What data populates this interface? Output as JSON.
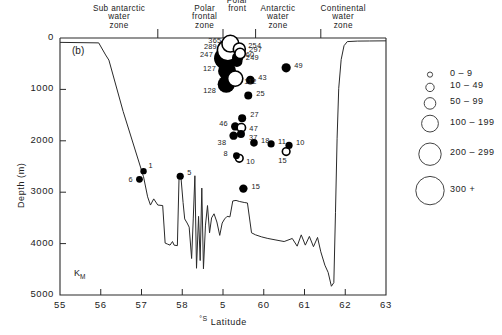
{
  "figure": {
    "panel_id": "(b)",
    "section_code": "K",
    "section_code_sub": "M"
  },
  "axes": {
    "x": {
      "label_prefix": "°S",
      "label": "Latitude",
      "min": 55,
      "max": 63,
      "ticks": [
        "55",
        "56",
        "57",
        "58",
        "5",
        "60",
        "61",
        "62",
        "63"
      ]
    },
    "y": {
      "label": "Depth (m)",
      "min": 0,
      "max": 5000,
      "ticks": [
        "0",
        "1000",
        "2000",
        "3000",
        "4000",
        "5000"
      ]
    }
  },
  "zones": [
    {
      "name": "subantarctic-water-zone",
      "lines": "Sub antarctic\nwater\nzone",
      "center_lat": 56.45
    },
    {
      "name": "polar-frontal-zone",
      "lines": "Polar\nfrontal\nzone",
      "center_lat": 58.55
    },
    {
      "name": "polar-front",
      "lines": "Polar\nfront",
      "center_lat": 59.35
    },
    {
      "name": "antarctic-water-zone",
      "lines": "Antarctic\nwater\nzone",
      "center_lat": 60.35
    },
    {
      "name": "continental-water-zone",
      "lines": "Continental\nwater\nzone",
      "center_lat": 61.95
    }
  ],
  "zone_dividers": [
    57.4,
    59.0,
    59.8,
    61.4
  ],
  "legend": {
    "title": "",
    "items": [
      {
        "label": "0 – 9",
        "radius": 2.6
      },
      {
        "label": "10 – 49",
        "radius": 4.2
      },
      {
        "label": "50 – 99",
        "radius": 5.8
      },
      {
        "label": "100 – 199",
        "radius": 8.4
      },
      {
        "label": "200 – 299",
        "radius": 11.2
      },
      {
        "label": "300 +",
        "radius": 14.2
      }
    ]
  },
  "chart_data": {
    "type": "scatter",
    "title": "",
    "xlabel": "°S Latitude",
    "ylabel": "Depth (m)",
    "xlim": [
      55,
      63
    ],
    "ylim": [
      5000,
      0
    ],
    "grid": false,
    "legend_position": "right",
    "value_encoding": "marker area encodes abundance class",
    "fill_encoding": "filled = solid symbol, open = open symbol",
    "points": [
      {
        "value": 365,
        "lat": 59.18,
        "depth": 110,
        "fill": "open",
        "r": 8.4,
        "label_dx": -22,
        "label_dy": -3
      },
      {
        "value": 289,
        "lat": 59.12,
        "depth": 240,
        "fill": "open",
        "r": 10.5,
        "label_dx": -24,
        "label_dy": -3
      },
      {
        "value": 254,
        "lat": 59.4,
        "depth": 215,
        "fill": "open",
        "r": 6.0,
        "label_dx": 9,
        "label_dy": -3
      },
      {
        "value": 297,
        "lat": 59.42,
        "depth": 300,
        "fill": "open",
        "r": 5.2,
        "label_dx": 9,
        "label_dy": -3
      },
      {
        "value": 247,
        "lat": 59.05,
        "depth": 395,
        "fill": "filled",
        "r": 11.0,
        "label_dx": -25,
        "label_dy": -3
      },
      {
        "value": 60,
        "lat": 59.36,
        "depth": 380,
        "fill": "filled",
        "r": 5.6,
        "label_dx": 8,
        "label_dy": -3
      },
      {
        "value": 249,
        "lat": 59.34,
        "depth": 455,
        "fill": "filled",
        "r": 5.6,
        "label_dx": 9,
        "label_dy": -3
      },
      {
        "value": 127,
        "lat": 59.1,
        "depth": 640,
        "fill": "filled",
        "r": 9.0,
        "label_dx": -24,
        "label_dy": -2
      },
      {
        "value": 112,
        "lat": 59.3,
        "depth": 790,
        "fill": "open",
        "r": 7.6,
        "label_dx": 9,
        "label_dy": 3
      },
      {
        "value": 128,
        "lat": 59.08,
        "depth": 900,
        "fill": "filled",
        "r": 8.6,
        "label_dx": -23,
        "label_dy": 7
      },
      {
        "value": 49,
        "lat": 60.55,
        "depth": 580,
        "fill": "filled",
        "r": 4.6,
        "label_dx": 8,
        "label_dy": -2
      },
      {
        "value": 43,
        "lat": 59.67,
        "depth": 820,
        "fill": "filled",
        "r": 4.4,
        "label_dx": 8,
        "label_dy": -2
      },
      {
        "value": 25,
        "lat": 59.62,
        "depth": 1120,
        "fill": "filled",
        "r": 4.0,
        "label_dx": 8,
        "label_dy": -2
      },
      {
        "value": 27,
        "lat": 59.47,
        "depth": 1560,
        "fill": "filled",
        "r": 4.0,
        "label_dx": 8,
        "label_dy": -3
      },
      {
        "value": 46,
        "lat": 59.3,
        "depth": 1720,
        "fill": "filled",
        "r": 4.2,
        "label_dx": -16,
        "label_dy": -2
      },
      {
        "value": 47,
        "lat": 59.45,
        "depth": 1745,
        "fill": "open",
        "r": 4.2,
        "label_dx": 8,
        "label_dy": 1
      },
      {
        "value": 37,
        "lat": 59.44,
        "depth": 1870,
        "fill": "filled",
        "r": 4.0,
        "label_dx": 8,
        "label_dy": 4
      },
      {
        "value": 38,
        "lat": 59.26,
        "depth": 1900,
        "fill": "filled",
        "r": 4.2,
        "label_dx": -16,
        "label_dy": 7
      },
      {
        "value": 18,
        "lat": 59.76,
        "depth": 2040,
        "fill": "filled",
        "r": 3.8,
        "label_dx": 7,
        "label_dy": -2
      },
      {
        "value": 11,
        "lat": 60.18,
        "depth": 2060,
        "fill": "filled",
        "r": 3.6,
        "label_dx": 7,
        "label_dy": -2
      },
      {
        "value": 10,
        "lat": 60.62,
        "depth": 2090,
        "fill": "filled",
        "r": 3.6,
        "label_dx": 7,
        "label_dy": -2
      },
      {
        "value": 8,
        "lat": 59.33,
        "depth": 2290,
        "fill": "filled",
        "r": 3.4,
        "label_dx": -13,
        "label_dy": -2
      },
      {
        "value": 10,
        "lat": 59.4,
        "depth": 2340,
        "fill": "open",
        "r": 3.8,
        "label_dx": 7,
        "label_dy": 4
      },
      {
        "value": 15,
        "lat": 60.55,
        "depth": 2210,
        "fill": "open",
        "r": 3.8,
        "label_dx": -8,
        "label_dy": 9
      },
      {
        "value": 15,
        "lat": 59.5,
        "depth": 2930,
        "fill": "filled",
        "r": 4.2,
        "label_dx": 8,
        "label_dy": -2
      },
      {
        "value": 1,
        "lat": 57.05,
        "depth": 2590,
        "fill": "filled",
        "r": 3.2,
        "label_dx": 5,
        "label_dy": -5
      },
      {
        "value": 6,
        "lat": 56.95,
        "depth": 2750,
        "fill": "filled",
        "r": 3.4,
        "label_dx": -11,
        "label_dy": 1
      },
      {
        "value": 5,
        "lat": 57.95,
        "depth": 2690,
        "fill": "filled",
        "r": 3.6,
        "label_dx": 7,
        "label_dy": -3
      }
    ],
    "seafloor": [
      [
        55.0,
        85
      ],
      [
        55.95,
        95
      ],
      [
        56.12,
        330
      ],
      [
        56.2,
        430
      ],
      [
        56.55,
        1430
      ],
      [
        57.05,
        2700
      ],
      [
        57.15,
        3090
      ],
      [
        57.22,
        3250
      ],
      [
        57.3,
        3130
      ],
      [
        57.4,
        3250
      ],
      [
        57.52,
        3260
      ],
      [
        57.58,
        3990
      ],
      [
        57.64,
        4010
      ],
      [
        57.7,
        4030
      ],
      [
        57.76,
        3960
      ],
      [
        57.8,
        4030
      ],
      [
        57.88,
        4040
      ],
      [
        57.92,
        2760
      ],
      [
        57.96,
        2630
      ],
      [
        58.02,
        3200
      ],
      [
        58.06,
        3520
      ],
      [
        58.12,
        3600
      ],
      [
        58.17,
        3680
      ],
      [
        58.23,
        4290
      ],
      [
        58.27,
        3520
      ],
      [
        58.31,
        2680
      ],
      [
        58.35,
        4480
      ],
      [
        58.4,
        3470
      ],
      [
        58.44,
        4330
      ],
      [
        58.48,
        2920
      ],
      [
        58.52,
        4490
      ],
      [
        58.57,
        3640
      ],
      [
        58.62,
        3260
      ],
      [
        58.67,
        3790
      ],
      [
        58.72,
        3500
      ],
      [
        58.78,
        3420
      ],
      [
        58.85,
        3580
      ],
      [
        58.92,
        3840
      ],
      [
        58.98,
        3600
      ],
      [
        59.04,
        3520
      ],
      [
        59.1,
        3470
      ],
      [
        59.17,
        3480
      ],
      [
        59.24,
        3170
      ],
      [
        59.32,
        3160
      ],
      [
        59.4,
        3180
      ],
      [
        59.52,
        3200
      ],
      [
        59.6,
        3210
      ],
      [
        59.7,
        3790
      ],
      [
        59.8,
        3830
      ],
      [
        59.95,
        3870
      ],
      [
        60.1,
        3900
      ],
      [
        60.3,
        3930
      ],
      [
        60.5,
        3960
      ],
      [
        60.7,
        3900
      ],
      [
        60.82,
        4050
      ],
      [
        60.92,
        3830
      ],
      [
        61.02,
        4030
      ],
      [
        61.12,
        3860
      ],
      [
        61.22,
        4060
      ],
      [
        61.32,
        3880
      ],
      [
        61.4,
        4160
      ],
      [
        61.5,
        4420
      ],
      [
        61.58,
        4560
      ],
      [
        61.66,
        4830
      ],
      [
        61.72,
        4760
      ],
      [
        61.76,
        3400
      ],
      [
        61.8,
        1950
      ],
      [
        61.84,
        980
      ],
      [
        61.9,
        420
      ],
      [
        61.97,
        150
      ],
      [
        62.05,
        70
      ],
      [
        62.3,
        60
      ],
      [
        62.6,
        58
      ],
      [
        63.0,
        55
      ]
    ]
  }
}
